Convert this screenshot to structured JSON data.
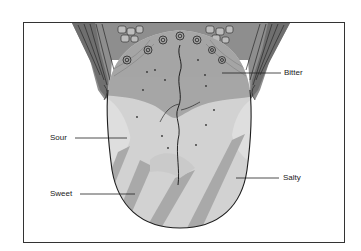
{
  "diagram": {
    "labels": {
      "bitter": "Bitter",
      "sour": "Sour",
      "sweet": "Sweet",
      "salty": "Salty"
    },
    "colors": {
      "bitter_region": "#a6a6a6",
      "body_region": "#d2d2d2",
      "stripe": "#a9a9a9",
      "outline": "#1e1e1e",
      "frame": "#333333"
    }
  }
}
